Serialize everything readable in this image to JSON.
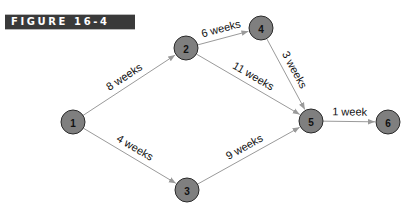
{
  "figure": {
    "label": "FIGURE 16-4"
  },
  "colors": {
    "node_fill": "#7f7f7f",
    "node_stroke": "#2a2a2a",
    "edge": "#9a9a9a",
    "banner_bg": "#3a3a3a",
    "banner_text": "#ffffff"
  },
  "nodes": [
    {
      "id": "1",
      "label": "1",
      "x": 73,
      "y": 122
    },
    {
      "id": "2",
      "label": "2",
      "x": 186,
      "y": 48
    },
    {
      "id": "3",
      "label": "3",
      "x": 187,
      "y": 190
    },
    {
      "id": "4",
      "label": "4",
      "x": 261,
      "y": 28
    },
    {
      "id": "5",
      "label": "5",
      "x": 311,
      "y": 121
    },
    {
      "id": "6",
      "label": "6",
      "x": 388,
      "y": 122
    }
  ],
  "edges": [
    {
      "from": "1",
      "to": "2",
      "label": "8 weeks"
    },
    {
      "from": "1",
      "to": "3",
      "label": "4 weeks"
    },
    {
      "from": "2",
      "to": "4",
      "label": "6 weeks"
    },
    {
      "from": "2",
      "to": "5",
      "label": "11 weeks"
    },
    {
      "from": "4",
      "to": "5",
      "label": "3 weeks"
    },
    {
      "from": "3",
      "to": "5",
      "label": "9 weeks"
    },
    {
      "from": "5",
      "to": "6",
      "label": "1 week"
    }
  ]
}
